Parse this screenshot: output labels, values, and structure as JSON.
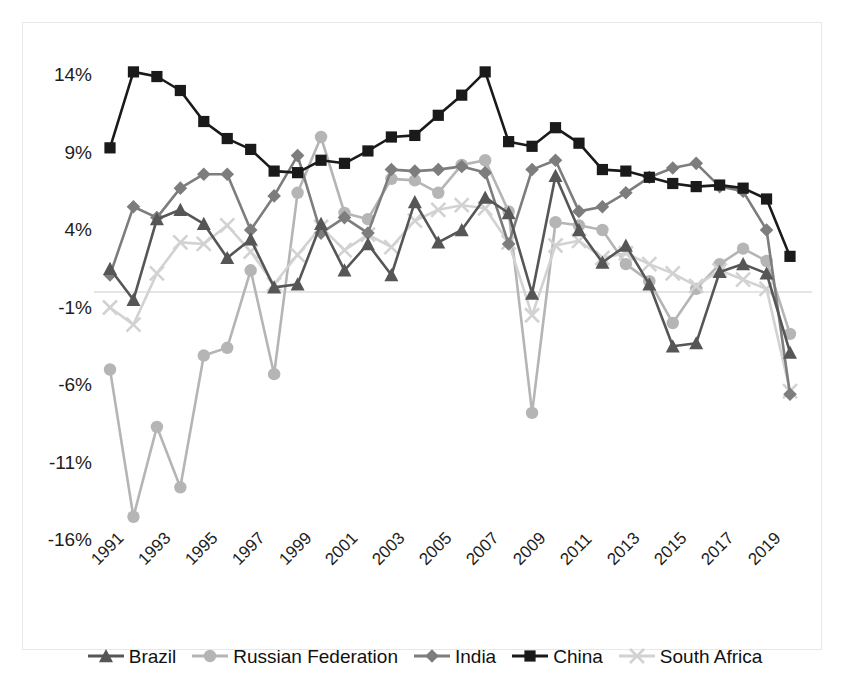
{
  "chart_data": {
    "type": "line",
    "title": "",
    "xlabel": "",
    "ylabel": "",
    "x": [
      1991,
      1992,
      1993,
      1994,
      1995,
      1996,
      1997,
      1998,
      1999,
      2000,
      2001,
      2002,
      2003,
      2004,
      2005,
      2006,
      2007,
      2008,
      2009,
      2010,
      2011,
      2012,
      2013,
      2014,
      2015,
      2016,
      2017,
      2018,
      2019,
      2020
    ],
    "xtick_labels": [
      "1991",
      "1993",
      "1995",
      "1997",
      "1999",
      "2001",
      "2003",
      "2005",
      "2007",
      "2009",
      "2011",
      "2013",
      "2015",
      "2017",
      "2019"
    ],
    "ytick_labels": [
      "14%",
      "9%",
      "4%",
      "-1%",
      "-6%",
      "-11%",
      "-16%"
    ],
    "ytick_values": [
      14,
      9,
      4,
      -1,
      -6,
      -11,
      -16
    ],
    "ylim": [
      -18.5,
      16.0
    ],
    "grid": "zero-line-only",
    "legend_position": "bottom",
    "series": [
      {
        "name": "Brazil",
        "marker": "triangle",
        "color": "#565656",
        "values": [
          1.5,
          -0.5,
          4.7,
          5.3,
          4.4,
          2.2,
          3.4,
          0.3,
          0.5,
          4.4,
          1.4,
          3.1,
          1.1,
          5.8,
          3.2,
          4.0,
          6.1,
          5.1,
          -0.1,
          7.5,
          4.0,
          1.9,
          3.0,
          0.5,
          -3.5,
          -3.3,
          1.3,
          1.8,
          1.2,
          -3.9
        ]
      },
      {
        "name": "Russian Federation",
        "marker": "circle",
        "color": "#b5b5b5",
        "values": [
          -5.0,
          -14.5,
          -8.7,
          -12.6,
          -4.1,
          -3.6,
          1.4,
          -5.3,
          6.4,
          10.0,
          5.1,
          4.7,
          7.3,
          7.2,
          6.4,
          8.2,
          8.5,
          5.2,
          -7.8,
          4.5,
          4.3,
          4.0,
          1.8,
          0.7,
          -2.0,
          0.2,
          1.8,
          2.8,
          2.0,
          -2.7
        ]
      },
      {
        "name": "India",
        "marker": "diamond",
        "color": "#7d7d7d",
        "values": [
          1.1,
          5.5,
          4.8,
          6.7,
          7.6,
          7.6,
          4.0,
          6.2,
          8.8,
          3.8,
          4.8,
          3.8,
          7.9,
          7.8,
          7.9,
          8.1,
          7.7,
          3.1,
          7.9,
          8.5,
          5.2,
          5.5,
          6.4,
          7.4,
          8.0,
          8.3,
          6.8,
          6.5,
          4.0,
          -6.6
        ]
      },
      {
        "name": "China",
        "marker": "square",
        "color": "#1a1a1a",
        "values": [
          9.3,
          14.2,
          13.9,
          13.0,
          11.0,
          9.9,
          9.2,
          7.8,
          7.7,
          8.5,
          8.3,
          9.1,
          10.0,
          10.1,
          11.4,
          12.7,
          14.2,
          9.7,
          9.4,
          10.6,
          9.6,
          7.9,
          7.8,
          7.4,
          7.0,
          6.8,
          6.9,
          6.7,
          6.0,
          2.3
        ]
      },
      {
        "name": "South Africa",
        "marker": "cross",
        "color": "#d2d2d2",
        "values": [
          -1.0,
          -2.1,
          1.2,
          3.2,
          3.1,
          4.3,
          2.6,
          0.5,
          2.4,
          4.2,
          2.7,
          3.7,
          2.9,
          4.6,
          5.3,
          5.6,
          5.4,
          3.2,
          -1.5,
          3.0,
          3.3,
          2.2,
          2.5,
          1.8,
          1.2,
          0.4,
          1.4,
          0.8,
          0.2,
          -6.4
        ]
      }
    ]
  },
  "legend": {
    "items": [
      {
        "label": "Brazil"
      },
      {
        "label": "Russian Federation"
      },
      {
        "label": "India"
      },
      {
        "label": "China"
      },
      {
        "label": "South Africa"
      }
    ]
  }
}
